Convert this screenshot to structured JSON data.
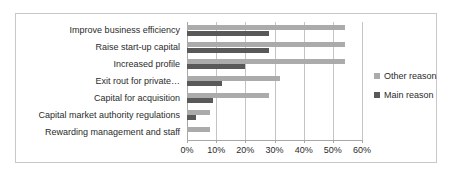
{
  "chart_data": {
    "type": "bar",
    "orientation": "horizontal",
    "title": "",
    "xlabel": "",
    "ylabel": "",
    "xlim": [
      0,
      60
    ],
    "xticks": [
      "0%",
      "10%",
      "20%",
      "30%",
      "40%",
      "50%",
      "60%"
    ],
    "xtick_values": [
      0,
      10,
      20,
      30,
      40,
      50,
      60
    ],
    "grid": true,
    "legend_position": "right",
    "categories": [
      "Improve business efficiency",
      "Raise start-up capital",
      "Increased profile",
      "Exit rout for private…",
      "Capital for acquisition",
      "Capital market authority regulations",
      "Rewarding management and staff"
    ],
    "series": [
      {
        "name": "Other reason",
        "color": "#ababab",
        "values": [
          54,
          54,
          54,
          32,
          28,
          8,
          8
        ]
      },
      {
        "name": "Main reason",
        "color": "#595959",
        "values": [
          28,
          28,
          20,
          12,
          9,
          3,
          0
        ]
      }
    ]
  },
  "legend": {
    "entries": [
      {
        "label": "Other reason",
        "swatch": "other"
      },
      {
        "label": "Main reason",
        "swatch": "main"
      }
    ]
  },
  "colors": {
    "other_reason": "#ababab",
    "main_reason": "#595959",
    "gridline": "#c4c4c4",
    "frame": "#c8c8c8",
    "text": "#2b2b2b"
  }
}
